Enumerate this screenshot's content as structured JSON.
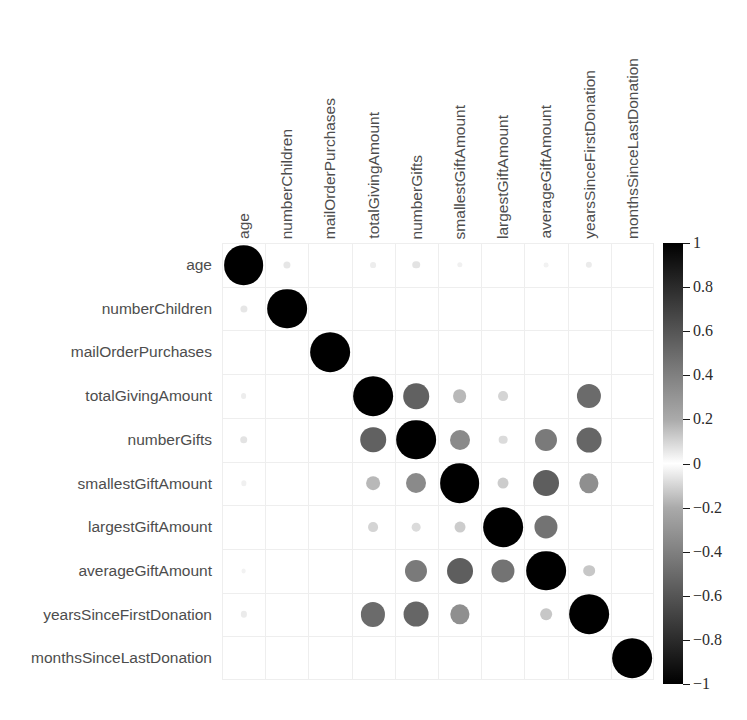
{
  "chart_data": {
    "type": "heatmap",
    "title": "",
    "subtitle": "",
    "xlabel": "",
    "ylabel": "",
    "variant": "correlation-matrix-circles",
    "grid": true,
    "legend_position": "right",
    "categories": [
      "age",
      "numberChildren",
      "mailOrderPurchases",
      "totalGivingAmount",
      "numberGifts",
      "smallestGiftAmount",
      "largestGiftAmount",
      "averageGiftAmount",
      "yearsSinceFirstDonation",
      "monthsSinceLastDonation"
    ],
    "x_tick_labels": [
      "age",
      "numberChildren",
      "mailOrderPurchases",
      "totalGivingAmount",
      "numberGifts",
      "smallestGiftAmount",
      "largestGiftAmount",
      "averageGiftAmount",
      "yearsSinceFirstDonation",
      "monthsSinceLastDonation"
    ],
    "y_tick_labels": [
      "age",
      "numberChildren",
      "mailOrderPurchases",
      "totalGivingAmount",
      "numberGifts",
      "smallestGiftAmount",
      "largestGiftAmount",
      "averageGiftAmount",
      "yearsSinceFirstDonation",
      "monthsSinceLastDonation"
    ],
    "zlim": [
      -1,
      1
    ],
    "colorbar": {
      "min": -1,
      "max": 1,
      "tick_values": [
        1,
        0.8,
        0.6,
        0.4,
        0.2,
        0,
        -0.2,
        -0.4,
        -0.6,
        -0.8,
        -1
      ],
      "tick_labels": [
        "1",
        "0.8",
        "0.6",
        "0.4",
        "0.2",
        "0",
        "−0.2",
        "−0.4",
        "−0.6",
        "−0.8",
        "−1"
      ],
      "colormap": "grayscale-diverging",
      "color_high": "#000000",
      "color_mid": "#ffffff",
      "color_low": "#000000"
    },
    "matrix": [
      [
        1.0,
        0.1,
        0.0,
        0.07,
        0.11,
        0.06,
        0.0,
        0.05,
        0.08,
        0.0
      ],
      [
        0.1,
        1.0,
        0.0,
        0.0,
        0.0,
        0.0,
        0.0,
        0.0,
        0.0,
        0.0
      ],
      [
        0.0,
        0.0,
        1.0,
        0.0,
        0.0,
        0.0,
        0.0,
        0.0,
        0.0,
        0.0
      ],
      [
        0.07,
        0.0,
        0.0,
        1.0,
        0.62,
        0.28,
        0.17,
        0.0,
        0.58,
        0.0
      ],
      [
        0.11,
        0.0,
        0.0,
        0.62,
        1.0,
        0.46,
        0.14,
        0.52,
        0.6,
        0.0
      ],
      [
        0.06,
        0.0,
        0.0,
        0.28,
        0.46,
        1.0,
        0.2,
        0.63,
        0.44,
        0.0
      ],
      [
        0.0,
        0.0,
        0.0,
        0.17,
        0.14,
        0.2,
        1.0,
        0.55,
        0.0,
        0.0
      ],
      [
        0.05,
        0.0,
        0.0,
        0.0,
        0.52,
        0.63,
        0.55,
        1.0,
        0.22,
        0.0
      ],
      [
        0.08,
        0.0,
        0.0,
        0.58,
        0.6,
        0.44,
        0.0,
        0.22,
        1.0,
        0.0
      ],
      [
        0.0,
        0.0,
        0.0,
        0.0,
        0.0,
        0.0,
        0.0,
        0.0,
        0.0,
        1.0
      ]
    ]
  }
}
